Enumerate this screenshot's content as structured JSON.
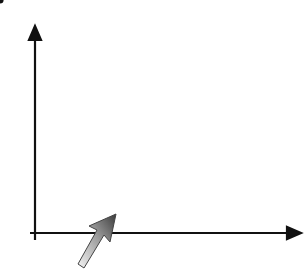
{
  "diagram": {
    "type": "enlargement-on-coordinate-grid",
    "axes": {
      "x_label": "x",
      "y_label": "y",
      "origin_label": "0",
      "x_ticks": [
        "2",
        "4",
        "6",
        "8",
        "10"
      ],
      "y_ticks": [
        "2",
        "4",
        "6",
        "8"
      ],
      "x_range": [
        0,
        12
      ],
      "y_range": [
        0,
        10
      ]
    },
    "center_of_enlargement": {
      "x": 2,
      "y": 2
    },
    "object_triangle": {
      "color": "#111111",
      "vertices": [
        [
          6,
          10
        ],
        [
          6,
          4
        ],
        [
          12,
          4
        ]
      ]
    },
    "image_triangle": {
      "color": "#7a7a7a",
      "vertices": [
        [
          4,
          6
        ],
        [
          4,
          3
        ],
        [
          7,
          3
        ]
      ]
    },
    "construction_lines": {
      "style": "dashed",
      "color": "#333333",
      "from": [
        2,
        2
      ],
      "to": [
        [
          6,
          10
        ],
        [
          6,
          4
        ],
        [
          12,
          4
        ]
      ]
    },
    "pointer": {
      "icon": "pen-pointer-arrow-icon",
      "colors": [
        "#f2f2f2",
        "#4a4a4a"
      ]
    },
    "grid_color": "#d6d6d6"
  }
}
